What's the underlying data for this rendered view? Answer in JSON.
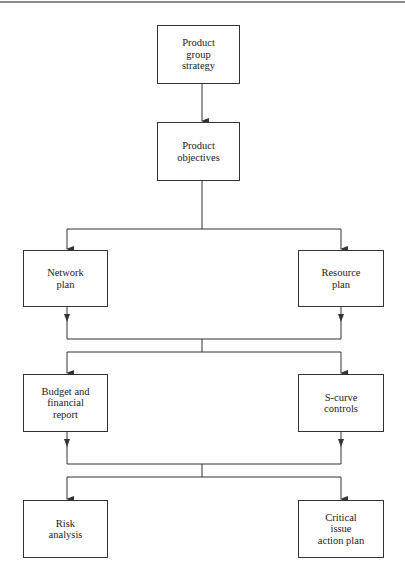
{
  "diagram": {
    "type": "flowchart",
    "colors": {
      "line": "#333333",
      "box_border": "#333333",
      "text": "#222222",
      "top_rule": "#8a8a8a",
      "background": "#ffffff"
    },
    "nodes": [
      {
        "id": "product-group-strategy",
        "label": "Product\ngroup\nstrategy"
      },
      {
        "id": "product-objectives",
        "label": "Product\nobjectives"
      },
      {
        "id": "network-plan",
        "label": "Network\nplan"
      },
      {
        "id": "resource-plan",
        "label": "Resource\nplan"
      },
      {
        "id": "budget-financial-report",
        "label": "Budget and\nfinancial\nreport"
      },
      {
        "id": "s-curve-controls",
        "label": "S-curve\ncontrols"
      },
      {
        "id": "risk-analysis",
        "label": "Risk\nanalysis"
      },
      {
        "id": "critical-issue-action-plan",
        "label": "Critical\nissue\naction plan"
      }
    ],
    "edges": [
      {
        "from": "product-group-strategy",
        "to": "product-objectives"
      },
      {
        "from": "product-objectives",
        "to": "network-plan"
      },
      {
        "from": "product-objectives",
        "to": "resource-plan"
      },
      {
        "from": "network-plan",
        "to": "budget-financial-report"
      },
      {
        "from": "network-plan",
        "to": "s-curve-controls"
      },
      {
        "from": "resource-plan",
        "to": "budget-financial-report"
      },
      {
        "from": "resource-plan",
        "to": "s-curve-controls"
      },
      {
        "from": "budget-financial-report",
        "to": "risk-analysis"
      },
      {
        "from": "budget-financial-report",
        "to": "critical-issue-action-plan"
      },
      {
        "from": "s-curve-controls",
        "to": "risk-analysis"
      },
      {
        "from": "s-curve-controls",
        "to": "critical-issue-action-plan"
      }
    ]
  }
}
